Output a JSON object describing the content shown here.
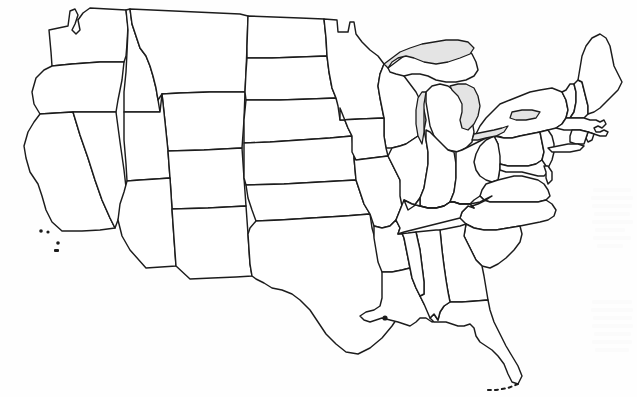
{
  "document": {
    "type": "map",
    "title": "Outline map of the contiguous United States",
    "subject": "United States state boundaries",
    "style": "black-and-white line-art scan, unlabeled",
    "background_color": "#fefefe",
    "line_color": "#1c1c1c",
    "lake_fill_color": "#e4e4e4",
    "width_px": 637,
    "height_px": 397
  },
  "map": {
    "projection_look": "conic",
    "labels_visible": false,
    "regions_shaded": [
      "Lake Superior",
      "Lake Michigan",
      "Lake Huron",
      "Lake Erie",
      "Lake Ontario"
    ],
    "features": [
      {
        "name": "great-lakes",
        "label": "Great Lakes",
        "shaded": true
      },
      {
        "name": "channel-islands",
        "label": "Channel Islands",
        "shaded": false
      },
      {
        "name": "florida-keys",
        "label": "Florida Keys",
        "shaded": false
      },
      {
        "name": "long-island",
        "label": "Long Island",
        "shaded": false
      },
      {
        "name": "cape-cod",
        "label": "Cape Cod",
        "shaded": false
      },
      {
        "name": "outer-banks",
        "label": "Outer Banks",
        "shaded": false
      },
      {
        "name": "delmarva-peninsula",
        "label": "Delmarva Peninsula",
        "shaded": false
      },
      {
        "name": "mississippi-delta",
        "label": "Mississippi River Delta",
        "shaded": false
      },
      {
        "name": "puget-sound",
        "label": "Puget Sound",
        "shaded": false
      },
      {
        "name": "northwest-angle",
        "label": "Minnesota Northwest Angle",
        "shaded": false
      }
    ],
    "states": [
      {
        "code": "WA",
        "name": "Washington"
      },
      {
        "code": "OR",
        "name": "Oregon"
      },
      {
        "code": "CA",
        "name": "California"
      },
      {
        "code": "NV",
        "name": "Nevada"
      },
      {
        "code": "ID",
        "name": "Idaho"
      },
      {
        "code": "MT",
        "name": "Montana"
      },
      {
        "code": "WY",
        "name": "Wyoming"
      },
      {
        "code": "UT",
        "name": "Utah"
      },
      {
        "code": "AZ",
        "name": "Arizona"
      },
      {
        "code": "CO",
        "name": "Colorado"
      },
      {
        "code": "NM",
        "name": "New Mexico"
      },
      {
        "code": "ND",
        "name": "North Dakota"
      },
      {
        "code": "SD",
        "name": "South Dakota"
      },
      {
        "code": "NE",
        "name": "Nebraska"
      },
      {
        "code": "KS",
        "name": "Kansas"
      },
      {
        "code": "OK",
        "name": "Oklahoma"
      },
      {
        "code": "TX",
        "name": "Texas"
      },
      {
        "code": "MN",
        "name": "Minnesota"
      },
      {
        "code": "IA",
        "name": "Iowa"
      },
      {
        "code": "MO",
        "name": "Missouri"
      },
      {
        "code": "AR",
        "name": "Arkansas"
      },
      {
        "code": "LA",
        "name": "Louisiana"
      },
      {
        "code": "WI",
        "name": "Wisconsin"
      },
      {
        "code": "IL",
        "name": "Illinois"
      },
      {
        "code": "MI",
        "name": "Michigan"
      },
      {
        "code": "IN",
        "name": "Indiana"
      },
      {
        "code": "OH",
        "name": "Ohio"
      },
      {
        "code": "KY",
        "name": "Kentucky"
      },
      {
        "code": "TN",
        "name": "Tennessee"
      },
      {
        "code": "MS",
        "name": "Mississippi"
      },
      {
        "code": "AL",
        "name": "Alabama"
      },
      {
        "code": "GA",
        "name": "Georgia"
      },
      {
        "code": "FL",
        "name": "Florida"
      },
      {
        "code": "SC",
        "name": "South Carolina"
      },
      {
        "code": "NC",
        "name": "North Carolina"
      },
      {
        "code": "VA",
        "name": "Virginia"
      },
      {
        "code": "WV",
        "name": "West Virginia"
      },
      {
        "code": "MD",
        "name": "Maryland"
      },
      {
        "code": "DE",
        "name": "Delaware"
      },
      {
        "code": "PA",
        "name": "Pennsylvania"
      },
      {
        "code": "NJ",
        "name": "New Jersey"
      },
      {
        "code": "NY",
        "name": "New York"
      },
      {
        "code": "CT",
        "name": "Connecticut"
      },
      {
        "code": "RI",
        "name": "Rhode Island"
      },
      {
        "code": "MA",
        "name": "Massachusetts"
      },
      {
        "code": "VT",
        "name": "Vermont"
      },
      {
        "code": "NH",
        "name": "New Hampshire"
      },
      {
        "code": "ME",
        "name": "Maine"
      }
    ]
  }
}
